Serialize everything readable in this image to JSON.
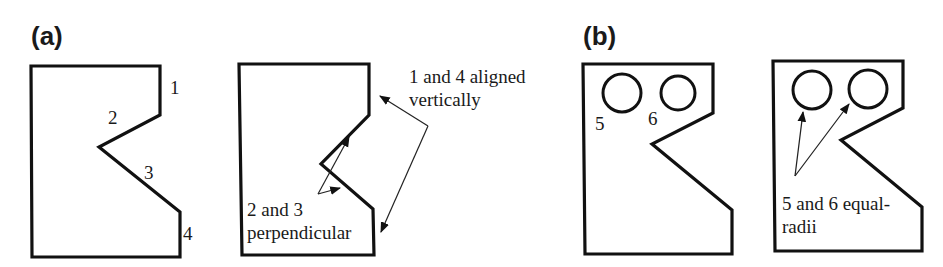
{
  "panels": [
    {
      "label": "(a)",
      "shapes": [
        {
          "id": "a-unconstrained",
          "edge_labels": [
            "1",
            "2",
            "3",
            "4"
          ]
        },
        {
          "id": "a-constrained",
          "annotations": [
            {
              "lines": [
                "1 and 4 aligned",
                "vertically"
              ]
            },
            {
              "lines": [
                "2 and 3",
                "perpendicular"
              ]
            }
          ]
        }
      ]
    },
    {
      "label": "(b)",
      "shapes": [
        {
          "id": "b-unconstrained",
          "edge_labels": [
            "5",
            "6"
          ]
        },
        {
          "id": "b-constrained",
          "annotations": [
            {
              "lines": [
                "5 and 6 equal-",
                "radii"
              ]
            }
          ]
        }
      ]
    }
  ],
  "colors": {
    "stroke": "#111111",
    "background": "#ffffff"
  }
}
